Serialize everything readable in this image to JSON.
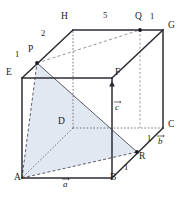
{
  "figure": {
    "type": "geometry-diagram",
    "shape": "cube",
    "stroke_color": "#2b2b33",
    "hidden_line_color": "#5a5a66",
    "shade_fill": "#dfe6ef",
    "background": "#ffffff"
  },
  "vertices": [
    {
      "name": "A",
      "label": "A",
      "x": 22,
      "y": 178
    },
    {
      "name": "B",
      "label": "B",
      "x": 112,
      "y": 178
    },
    {
      "name": "C",
      "label": "C",
      "x": 163,
      "y": 128
    },
    {
      "name": "D",
      "label": "D",
      "x": 73,
      "y": 128
    },
    {
      "name": "E",
      "label": "E",
      "x": 22,
      "y": 78
    },
    {
      "name": "F",
      "label": "F",
      "x": 112,
      "y": 78
    },
    {
      "name": "G",
      "label": "G",
      "x": 163,
      "y": 30
    },
    {
      "name": "H",
      "label": "H",
      "x": 73,
      "y": 30
    }
  ],
  "points": [
    {
      "name": "P",
      "label": "P",
      "on_edge": "EH",
      "x": 37,
      "y": 63
    },
    {
      "name": "Q",
      "label": "Q",
      "on_edge": "HG",
      "x": 140,
      "y": 30
    },
    {
      "name": "R",
      "label": "R",
      "on_edge": "BC",
      "x": 137,
      "y": 152
    }
  ],
  "vertex_labels": [
    {
      "id": "label-A",
      "text": "A",
      "x": 14,
      "y": 180
    },
    {
      "id": "label-B",
      "text": "B",
      "x": 110,
      "y": 180
    },
    {
      "id": "label-C",
      "text": "C",
      "x": 168,
      "y": 125
    },
    {
      "id": "label-D",
      "text": "D",
      "x": 59,
      "y": 120
    },
    {
      "id": "label-E",
      "text": "E",
      "x": 8,
      "y": 71
    },
    {
      "id": "label-F",
      "text": "F",
      "x": 116,
      "y": 70
    },
    {
      "id": "label-G",
      "text": "G",
      "x": 169,
      "y": 23
    },
    {
      "id": "label-H",
      "text": "H",
      "x": 63,
      "y": 14
    },
    {
      "id": "label-P",
      "text": "P",
      "x": 29,
      "y": 48
    },
    {
      "id": "label-Q",
      "text": "Q",
      "x": 137,
      "y": 15
    },
    {
      "id": "label-R",
      "text": "R",
      "x": 139,
      "y": 155
    }
  ],
  "length_labels": [
    {
      "id": "len-EP",
      "text": "1",
      "segment": "EP",
      "x": 18,
      "y": 54
    },
    {
      "id": "len-PH",
      "text": "2",
      "segment": "PH",
      "x": 42,
      "y": 33
    },
    {
      "id": "len-HQ",
      "text": "5",
      "segment": "HQ",
      "x": 104,
      "y": 14
    },
    {
      "id": "len-QG",
      "text": "1",
      "segment": "QG",
      "x": 152,
      "y": 15
    },
    {
      "id": "len-RC",
      "text": "1",
      "segment": "RC",
      "x": 148,
      "y": 138
    },
    {
      "id": "len-BR",
      "text": "1",
      "segment": "BR",
      "x": 125,
      "y": 167
    }
  ],
  "vector_labels": [
    {
      "id": "vec-a",
      "text": "a",
      "along": "AB",
      "x": 64,
      "y": 181
    },
    {
      "id": "vec-b",
      "text": "b",
      "along": "BC",
      "x": 159,
      "y": 139
    },
    {
      "id": "vec-c",
      "text": "c",
      "along": "BF",
      "x": 116,
      "y": 106
    }
  ],
  "shaded_region": {
    "name": "triangle-APR",
    "vertices": [
      "A",
      "P",
      "R"
    ],
    "fill": "#dfe6ef"
  }
}
